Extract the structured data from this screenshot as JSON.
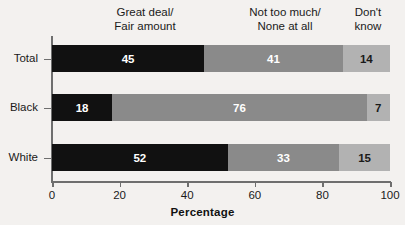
{
  "chart_data": {
    "type": "bar",
    "orientation": "horizontal",
    "stacked": true,
    "title": "",
    "xlabel": "Percentage",
    "ylabel": "",
    "xlim": [
      0,
      100
    ],
    "xticks": [
      0,
      20,
      40,
      60,
      80,
      100
    ],
    "grid": false,
    "legend_position": "top-inline-column-headers",
    "categories": [
      "Total",
      "Black",
      "White"
    ],
    "series": [
      {
        "name": "Great deal/\nFair amount",
        "name_line1": "Great deal/",
        "name_line2": "Fair amount",
        "color": "#111111",
        "label_color": "#ffffff",
        "values": [
          45,
          18,
          52
        ]
      },
      {
        "name": "Not too much/\nNone at all",
        "name_line1": "Not too much/",
        "name_line2": "None at all",
        "color": "#8a8a8a",
        "label_color": "#ffffff",
        "values": [
          41,
          76,
          33
        ]
      },
      {
        "name": "Don't know",
        "name_line1": "Don't",
        "name_line2": "know",
        "color": "#b2b2b2",
        "label_color": "#1a1a1a",
        "values": [
          14,
          7,
          15
        ]
      }
    ]
  },
  "axis": {
    "x_title": "Percentage",
    "tick_labels": [
      "0",
      "20",
      "40",
      "60",
      "80",
      "100"
    ]
  },
  "headers": {
    "great_line1": "Great deal/",
    "great_line2": "Fair amount",
    "nottoo_line1": "Not too much/",
    "nottoo_line2": "None at all",
    "dont_line1": "Don't",
    "dont_line2": "know"
  },
  "colors": {
    "background": "#f3f1ef",
    "axis": "#6e6e6e",
    "series_dark": "#111111",
    "series_medium": "#8a8a8a",
    "series_light": "#b2b2b2"
  }
}
